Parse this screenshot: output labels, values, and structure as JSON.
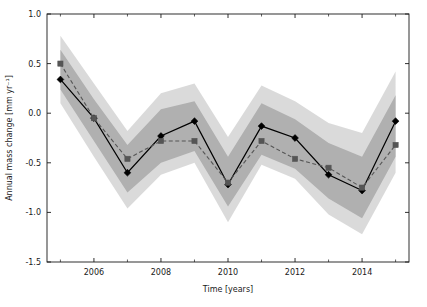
{
  "chart_data": {
    "type": "line",
    "title": "",
    "xlabel": "Time [years]",
    "ylabel": "Annual mass change [mm yr⁻¹]",
    "xlim": [
      2004.6,
      2015.4
    ],
    "ylim": [
      -1.5,
      1.0
    ],
    "xticks": [
      2006,
      2008,
      2010,
      2012,
      2014
    ],
    "xticklabels": [
      "2006",
      "2008",
      "2010",
      "2012",
      "2014"
    ],
    "xminorticks": [
      2005,
      2007,
      2009,
      2011,
      2013,
      2015
    ],
    "yticks": [
      -1.5,
      -1.0,
      -0.5,
      0.0,
      0.5,
      1.0
    ],
    "yticklabels": [
      "-1.5",
      "-1.0",
      "-0.5",
      "0.0",
      "0.5",
      "1.0"
    ],
    "grid": false,
    "legend": "none",
    "x": [
      2005,
      2006,
      2007,
      2008,
      2009,
      2010,
      2011,
      2012,
      2013,
      2014,
      2015
    ],
    "series": [
      {
        "name": "solid-line-diamonds",
        "marker": "diamond",
        "linestyle": "solid",
        "color": "#000000",
        "values": [
          0.34,
          -0.05,
          -0.6,
          -0.23,
          -0.08,
          -0.72,
          -0.13,
          -0.25,
          -0.62,
          -0.78,
          -0.08
        ]
      },
      {
        "name": "dashed-line-squares",
        "marker": "square",
        "linestyle": "dashed",
        "color": "#555555",
        "values": [
          0.5,
          -0.05,
          -0.46,
          -0.28,
          -0.28,
          -0.7,
          -0.28,
          -0.46,
          -0.55,
          -0.75,
          -0.32
        ]
      }
    ],
    "bands": [
      {
        "name": "outer-uncertainty-band",
        "color": "#d4d4d4",
        "opacity": 0.85,
        "upper": [
          0.78,
          0.3,
          -0.18,
          0.2,
          0.3,
          -0.24,
          0.28,
          0.12,
          -0.1,
          -0.2,
          0.42
        ],
        "lower": [
          0.1,
          -0.44,
          -0.96,
          -0.62,
          -0.5,
          -1.1,
          -0.52,
          -0.66,
          -1.02,
          -1.22,
          -0.6
        ]
      },
      {
        "name": "inner-uncertainty-band",
        "color": "#a8a8a8",
        "opacity": 0.85,
        "upper": [
          0.64,
          0.14,
          -0.32,
          0.04,
          0.12,
          -0.44,
          0.1,
          -0.06,
          -0.3,
          -0.44,
          0.18
        ],
        "lower": [
          0.24,
          -0.28,
          -0.8,
          -0.5,
          -0.38,
          -0.94,
          -0.42,
          -0.56,
          -0.86,
          -1.06,
          -0.44
        ]
      }
    ]
  }
}
